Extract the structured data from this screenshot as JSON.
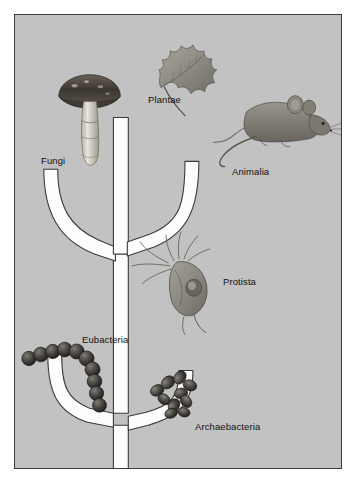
{
  "figure": {
    "panel_background": "#c2c2c2",
    "branch_fill": "#fdfdfd",
    "outline_color": "#3a3a3a"
  },
  "labels": {
    "fungi": "Fungi",
    "plantae": "Plantae",
    "animalia": "Animalia",
    "protista": "Protista",
    "eubacteria": "Eubacteria",
    "archaebacteria": "Archaebacteria"
  },
  "organisms": {
    "fungi": "mushroom-illustration",
    "plantae": "oak-leaf-illustration",
    "animalia": "mouse-illustration",
    "protista": "flagellate-protist-illustration",
    "eubacteria": "coccus-chain-illustration",
    "archaebacteria": "archaea-cluster-illustration"
  },
  "tree": {
    "root_label": "common ancestor trunk",
    "upper_node": "protista-node",
    "lower_node": "bacteria-node",
    "upper_branches": [
      "fungi",
      "plantae",
      "animalia"
    ],
    "lower_branches": [
      "eubacteria",
      "archaebacteria"
    ]
  }
}
